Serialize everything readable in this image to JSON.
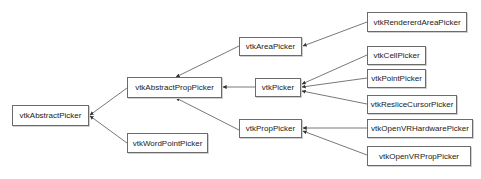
{
  "diagram": {
    "type": "class-inheritance",
    "colors": {
      "line": "#555555",
      "border": "#6b6b6b",
      "text": "#222222"
    },
    "nodes": [
      {
        "id": "vtkAbstractPicker",
        "label": "vtkAbstractPicker"
      },
      {
        "id": "vtkAbstractPropPicker",
        "label": "vtkAbstractPropPicker"
      },
      {
        "id": "vtkWordPointPicker",
        "label": "vtkWordPointPicker"
      },
      {
        "id": "vtkAreaPicker",
        "label": "vtkAreaPicker"
      },
      {
        "id": "vtkPicker",
        "label": "vtkPicker"
      },
      {
        "id": "vtkPropPicker",
        "label": "vtkPropPicker"
      },
      {
        "id": "vtkRendererdAreaPicker",
        "label": "vtkRendererdAreaPicker"
      },
      {
        "id": "vtkCellPicker",
        "label": "vtkCellPicker"
      },
      {
        "id": "vtkPointPicker",
        "label": "vtkPointPicker"
      },
      {
        "id": "vtkResliceCursorPicker",
        "label": "vtkResliceCursorPicker"
      },
      {
        "id": "vtkOpenVRHardwarePicker",
        "label": "vtkOpenVRHardwarePicker"
      },
      {
        "id": "vtkOpenVRPropPicker",
        "label": "vtkOpenVRPropPicker"
      }
    ],
    "edges": [
      {
        "from": "vtkAbstractPropPicker",
        "to": "vtkAbstractPicker"
      },
      {
        "from": "vtkWordPointPicker",
        "to": "vtkAbstractPicker"
      },
      {
        "from": "vtkAreaPicker",
        "to": "vtkAbstractPropPicker"
      },
      {
        "from": "vtkPicker",
        "to": "vtkAbstractPropPicker"
      },
      {
        "from": "vtkPropPicker",
        "to": "vtkAbstractPropPicker"
      },
      {
        "from": "vtkRendererdAreaPicker",
        "to": "vtkAreaPicker"
      },
      {
        "from": "vtkCellPicker",
        "to": "vtkPicker"
      },
      {
        "from": "vtkPointPicker",
        "to": "vtkPicker"
      },
      {
        "from": "vtkResliceCursorPicker",
        "to": "vtkPicker"
      },
      {
        "from": "vtkOpenVRHardwarePicker",
        "to": "vtkPropPicker"
      },
      {
        "from": "vtkOpenVRPropPicker",
        "to": "vtkPropPicker"
      }
    ]
  }
}
